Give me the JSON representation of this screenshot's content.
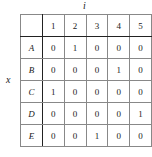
{
  "column_axis_label": "i",
  "row_axis_label": "x",
  "columns": [
    "",
    "1",
    "2",
    "3",
    "4",
    "5"
  ],
  "rows": [
    {
      "label": "A",
      "values": [
        "0",
        "1",
        "0",
        "0",
        "0"
      ]
    },
    {
      "label": "B",
      "values": [
        "0",
        "0",
        "0",
        "1",
        "0"
      ]
    },
    {
      "label": "C",
      "values": [
        "1",
        "0",
        "0",
        "0",
        "0"
      ]
    },
    {
      "label": "D",
      "values": [
        "0",
        "0",
        "0",
        "0",
        "1"
      ]
    },
    {
      "label": "E",
      "values": [
        "0",
        "0",
        "1",
        "0",
        "0"
      ]
    }
  ]
}
